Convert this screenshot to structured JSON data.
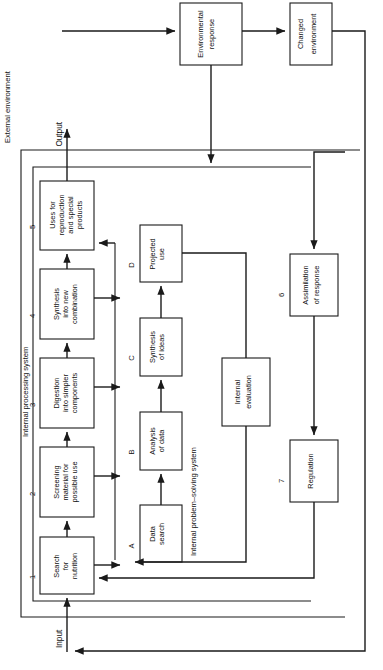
{
  "diagram": {
    "orientation": "rotated-90-ccw",
    "zones": [
      {
        "id": "external",
        "label": "External environment"
      },
      {
        "id": "internal_processing",
        "label": "Internal processing system"
      },
      {
        "id": "internal_problem_solving",
        "label": "Internal problem–solving system"
      }
    ],
    "io": {
      "input_label": "Input",
      "output_label": "Output"
    },
    "process_boxes": [
      {
        "num": "1",
        "lines": [
          "Search",
          "for",
          "nutrition"
        ]
      },
      {
        "num": "2",
        "lines": [
          "Screening",
          "material for",
          "possible use"
        ]
      },
      {
        "num": "3",
        "lines": [
          "Digestion",
          "into simpler",
          "components"
        ]
      },
      {
        "num": "4",
        "lines": [
          "Synthesis",
          "into new",
          "combination"
        ]
      },
      {
        "num": "5",
        "lines": [
          "Uses for",
          "reproduction",
          "and special",
          "products"
        ]
      }
    ],
    "problem_solving_boxes": [
      {
        "num": "A",
        "lines": [
          "Data",
          "search"
        ]
      },
      {
        "num": "B",
        "lines": [
          "Analysis",
          "of data"
        ]
      },
      {
        "num": "C",
        "lines": [
          "Synthesis",
          "of ideas"
        ]
      },
      {
        "num": "D",
        "lines": [
          "Projected",
          "use"
        ]
      }
    ],
    "evaluation_box": {
      "num": "",
      "lines": [
        "Internal",
        "evaluation"
      ]
    },
    "response_boxes": [
      {
        "num": "6",
        "lines": [
          "Assimilation",
          "of response"
        ]
      },
      {
        "num": "7",
        "lines": [
          "Regulation"
        ]
      }
    ],
    "environment_boxes": [
      {
        "id": "environmental_response",
        "lines": [
          "Environmental",
          "response"
        ]
      },
      {
        "id": "changed_environment",
        "lines": [
          "Changed",
          "environment"
        ]
      }
    ],
    "colors": {
      "stroke": "#1a1a1a",
      "text": "#111111",
      "background": "#ffffff"
    }
  }
}
